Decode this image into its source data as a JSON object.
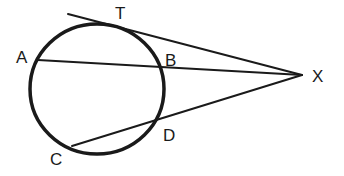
{
  "diagram": {
    "type": "geometry",
    "stroke_color": "#1a1a1a",
    "background": "#ffffff",
    "circle": {
      "cx": 97,
      "cy": 89,
      "rx": 67,
      "ry": 65
    },
    "points": {
      "T": {
        "label": "T",
        "x": 122,
        "y": 26,
        "label_x": 115,
        "label_y": 19
      },
      "A": {
        "label": "A",
        "x": 38,
        "y": 60,
        "label_x": 16,
        "label_y": 63
      },
      "B": {
        "label": "B",
        "x": 158,
        "y": 67,
        "label_x": 165,
        "label_y": 66
      },
      "C": {
        "label": "C",
        "x": 72,
        "y": 146,
        "label_x": 50,
        "label_y": 165
      },
      "D": {
        "label": "D",
        "x": 157,
        "y": 122,
        "label_x": 163,
        "label_y": 141
      },
      "X": {
        "label": "X",
        "x": 302,
        "y": 75,
        "label_x": 312,
        "label_y": 82
      }
    },
    "segments": [
      {
        "name": "tangent-XT",
        "from": [
          68,
          14
        ],
        "to": [
          302,
          75
        ]
      },
      {
        "name": "secant-XA",
        "from": [
          38,
          60
        ],
        "to": [
          302,
          75
        ]
      },
      {
        "name": "secant-XC",
        "from": [
          72,
          146
        ],
        "to": [
          302,
          75
        ]
      }
    ]
  }
}
